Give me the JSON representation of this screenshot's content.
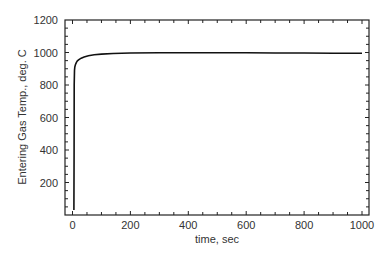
{
  "chart_data": {
    "type": "line",
    "title": "",
    "xlabel": "time, sec",
    "ylabel": "Entering Gas Temp., deg. C",
    "xlim": [
      -15,
      1025
    ],
    "ylim": [
      0,
      1200
    ],
    "x_ticks": [
      0,
      200,
      400,
      600,
      800,
      1000
    ],
    "x_tick_labels": [
      "0",
      "200",
      "400",
      "600",
      "800",
      "1000"
    ],
    "y_ticks": [
      200,
      400,
      600,
      800,
      1000,
      1200
    ],
    "y_tick_labels": [
      "200",
      "400",
      "600",
      "800",
      "1000",
      "1200"
    ],
    "grid": false,
    "legend": null,
    "series": [
      {
        "name": "Entering Gas Temp.",
        "color": "#111111",
        "x": [
          5,
          5.5,
          6,
          7,
          8,
          10,
          13,
          17,
          22,
          30,
          40,
          55,
          75,
          100,
          140,
          200,
          300,
          400,
          500,
          600,
          700,
          800,
          900,
          1000
        ],
        "y": [
          30,
          400,
          800,
          890,
          910,
          925,
          938,
          948,
          956,
          965,
          972,
          980,
          986,
          990,
          994,
          997,
          998,
          998,
          998,
          998,
          997,
          997,
          996,
          995
        ]
      }
    ]
  }
}
